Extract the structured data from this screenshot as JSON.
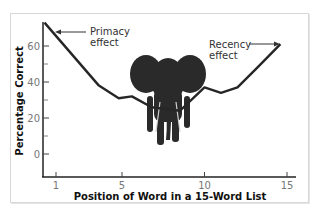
{
  "chart_data": {
    "type": "line",
    "title": "",
    "xlabel": "Position of Word in a 15-Word List",
    "ylabel": "Percentage Correct",
    "x_ticks": [
      1,
      5,
      10,
      15
    ],
    "y_ticks": [
      0,
      20,
      40,
      60
    ],
    "xlim": [
      0.3,
      16
    ],
    "ylim": [
      -10,
      75
    ],
    "grid": false,
    "legend": null,
    "series": [
      {
        "name": "Recall",
        "x": [
          0.3,
          3.6,
          4.8,
          5.6,
          6.8,
          8.5,
          10,
          11,
          12,
          13.2,
          14.6
        ],
        "values": [
          73,
          38,
          31,
          32,
          26,
          24,
          37,
          34,
          37,
          48,
          61
        ]
      }
    ],
    "annotations": [
      {
        "text_line1": "Primacy",
        "text_line2": "effect",
        "points_to": "start of curve"
      },
      {
        "text_line1": "Recency",
        "text_line2": "effect",
        "points_to": "end of curve"
      }
    ],
    "decoration": "elephant-image"
  }
}
